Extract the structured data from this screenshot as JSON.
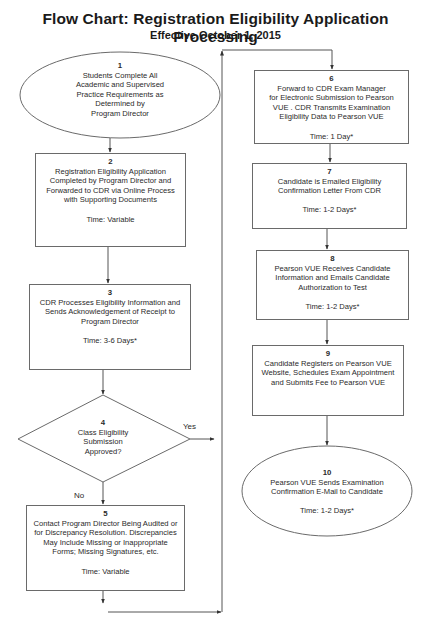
{
  "header": {
    "title": "Flow Chart:  Registration Eligibility Application Processing",
    "subtitle": "Effective October 1, 2015"
  },
  "colors": {
    "line": "#555555",
    "border": "#6a6a6a",
    "text": "#2a2a2a",
    "background": "#ffffff"
  },
  "steps": [
    {
      "number": "1",
      "shape": "ellipse",
      "lines": [
        "Students Complete All",
        "Academic and Supervised",
        "Practice Requirements as",
        "Determined by",
        "Program Director"
      ],
      "time": ""
    },
    {
      "number": "2",
      "shape": "box",
      "lines": [
        "Registration Eligibility Application",
        "Completed by Program Director and",
        "Forwarded to CDR via Online Process",
        "with Supporting Documents"
      ],
      "time": "Time:  Variable"
    },
    {
      "number": "3",
      "shape": "box",
      "lines": [
        "CDR Processes Eligibility Information and",
        "Sends Acknowledgement of Receipt to",
        "Program Director"
      ],
      "time": "Time:  3-6 Days*"
    },
    {
      "number": "4",
      "shape": "diamond",
      "lines": [
        "Class Eligibility",
        "Submission",
        "Approved?"
      ],
      "time": ""
    },
    {
      "number": "5",
      "shape": "box",
      "lines": [
        "Contact Program Director Being Audited or",
        "for Discrepancy Resolution.  Discrepancies",
        "May Include Missing or Inappropriate",
        "Forms; Missing Signatures, etc."
      ],
      "time": "Time:  Variable"
    },
    {
      "number": "6",
      "shape": "box",
      "lines": [
        "Forward to CDR Exam Manager",
        "for Electronic Submission to Pearson",
        "VUE . CDR Transmits Examination",
        "Eligibility Data to Pearson VUE"
      ],
      "time": "Time:  1 Day*"
    },
    {
      "number": "7",
      "shape": "box",
      "lines": [
        "Candidate is Emailed Eligibility",
        "Confirmation Letter From CDR"
      ],
      "time": "Time:  1-2 Days*"
    },
    {
      "number": "8",
      "shape": "box",
      "lines": [
        "Pearson VUE Receives Candidate",
        "Information and Emails Candidate",
        "Authorization to Test"
      ],
      "time": "Time:  1-2 Days*"
    },
    {
      "number": "9",
      "shape": "box",
      "lines": [
        "Candidate Registers on Pearson VUE",
        "Website, Schedules Exam Appointment",
        "and Submits Fee to Pearson VUE"
      ],
      "time": ""
    },
    {
      "number": "10",
      "shape": "ellipse",
      "lines": [
        "Pearson VUE Sends Examination",
        "Confirmation E-Mail to Candidate"
      ],
      "time": "Time:  1-2 Days*"
    }
  ],
  "decision_labels": {
    "yes": "Yes",
    "no": "No"
  }
}
